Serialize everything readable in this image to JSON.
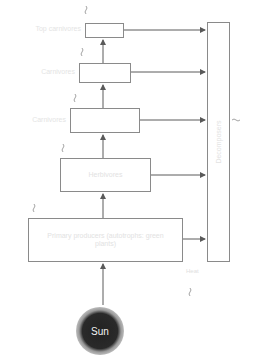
{
  "diagram": {
    "type": "energy-flow-trophic-levels",
    "levels": [
      {
        "side_label": "Top carnivores",
        "box_text": ""
      },
      {
        "side_label": "Carnivores",
        "box_text": ""
      },
      {
        "side_label": "Carnivores",
        "box_text": ""
      },
      {
        "side_label": "",
        "box_text": "Herbivores"
      },
      {
        "side_label": "",
        "box_text": "Primary producers (autotrophs: green plants)"
      }
    ],
    "decomposers_label": "Decomposers",
    "heat_label": "Heat",
    "sun_label": "Sun",
    "colors": {
      "line": "#5a5a5a",
      "box_border": "#8a8a8a",
      "sun": "#222222"
    }
  }
}
